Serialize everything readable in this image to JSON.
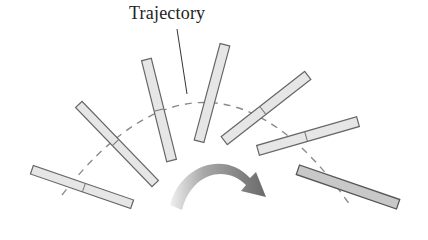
{
  "figure": {
    "title_label": "Trajectory",
    "colors": {
      "bar_fill": "#e6e6e6",
      "bar_fill_final": "#c8c8c8",
      "bar_stroke": "#666666",
      "trajectory": "#8a8a8a",
      "arrow_dark": "#6e6e6e",
      "arrow_light": "#e8e8e8"
    },
    "rods": [
      {
        "cx": 82,
        "cy": 187,
        "angle": 19
      },
      {
        "cx": 117,
        "cy": 144,
        "angle": 46
      },
      {
        "cx": 159,
        "cy": 110,
        "angle": 76
      },
      {
        "cx": 212,
        "cy": 93,
        "angle": -75
      },
      {
        "cx": 266,
        "cy": 108,
        "angle": -38
      },
      {
        "cx": 308,
        "cy": 136,
        "angle": -16
      },
      {
        "cx": 348,
        "cy": 187,
        "angle": 19,
        "final": true
      }
    ]
  }
}
